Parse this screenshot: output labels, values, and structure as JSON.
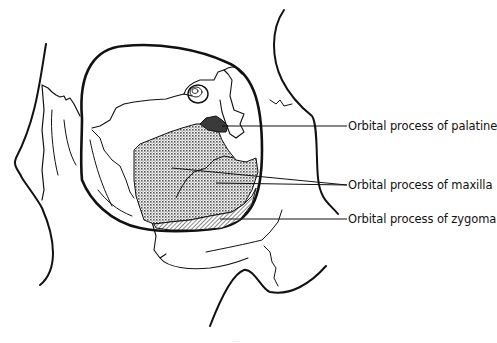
{
  "figure": {
    "labels": [
      {
        "text": "Orbital process of palatine",
        "x": 350,
        "y": 120,
        "leader_from": [
          225,
          127
        ]
      },
      {
        "text": "Orbital process of maxilla",
        "x": 350,
        "y": 178,
        "leader_from": [
          220,
          185
        ]
      },
      {
        "text": "Orbital process of zygoma",
        "x": 350,
        "y": 213,
        "leader_from": [
          220,
          219
        ]
      }
    ],
    "regions": [
      {
        "name": "palatine",
        "fill": "#3a3a3a",
        "pattern": "solid-dark"
      },
      {
        "name": "maxilla",
        "fill": "#bdbdbd",
        "pattern": "crosshatch-dots"
      },
      {
        "name": "zygoma",
        "fill": "#a8a8a8",
        "pattern": "diagonal-hatch"
      }
    ],
    "caption_partial": "...",
    "colors": {
      "line": "#111111",
      "background": "#ffffff"
    }
  }
}
